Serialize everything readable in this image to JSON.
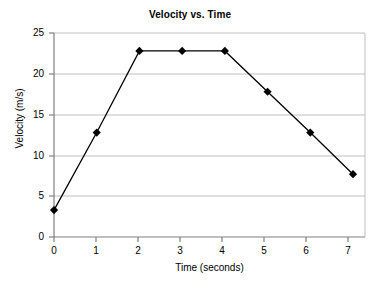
{
  "chart_data": {
    "type": "line",
    "title": "Velocity vs. Time",
    "xlabel": "Time (seconds)",
    "ylabel": "Velocity (m/s)",
    "x": [
      0,
      1,
      2,
      3,
      4,
      5,
      6,
      7
    ],
    "values": [
      3.3,
      12.8,
      22.8,
      22.8,
      22.8,
      17.8,
      12.8,
      7.7
    ],
    "series": [
      {
        "name": "Velocity",
        "values": [
          3.3,
          12.8,
          22.8,
          22.8,
          22.8,
          17.8,
          12.8,
          7.7
        ]
      }
    ],
    "xlim": [
      0,
      7
    ],
    "ylim": [
      0,
      25
    ],
    "xticks": [
      "0",
      "1",
      "2",
      "3",
      "4",
      "5",
      "6",
      "7"
    ],
    "yticks": [
      "0",
      "5",
      "10",
      "15",
      "20",
      "25"
    ],
    "grid": "horizontal",
    "legend": "none",
    "marker": "filled-diamond",
    "line_color": "#000000",
    "marker_color": "#000000",
    "grid_color": "#BFBFBF",
    "axis_color": "#7F7F7F",
    "background_color": "#FFFFFF"
  }
}
